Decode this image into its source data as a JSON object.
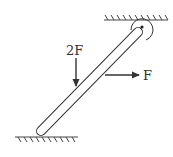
{
  "diagram": {
    "title": "",
    "labels": {
      "force_down": "2F",
      "force_right": "F"
    },
    "elements": {
      "ceiling": "fixed support (hatched)",
      "ground": "fixed support (hatched)",
      "pivot": "hinge pin at top end of rod",
      "rod": "inclined rod"
    },
    "colors": {
      "stroke": "#333333",
      "background": "#ffffff"
    }
  }
}
